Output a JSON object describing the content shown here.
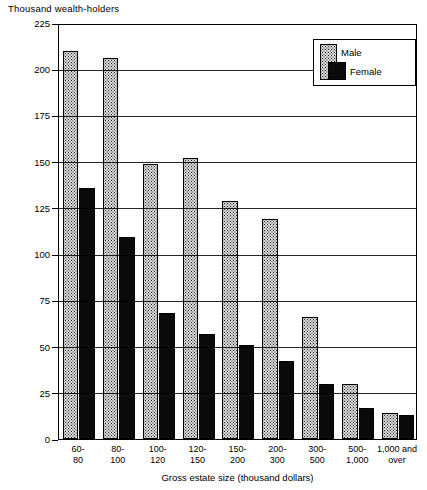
{
  "chart_data": {
    "type": "bar",
    "title": "",
    "ylabel": "Thousand wealth-holders",
    "xlabel": "Gross estate size  (thousand dollars)",
    "ylim": [
      0,
      225
    ],
    "yticks": [
      0,
      25,
      50,
      75,
      100,
      125,
      150,
      175,
      200,
      225
    ],
    "grid": true,
    "legend_position": "top-right",
    "categories": [
      "60-\n80",
      "80-\n100",
      "100-\n120",
      "120-\n150",
      "150-\n200",
      "200-\n300",
      "300-\n500",
      "500-\n1,000",
      "1,000 and\nover"
    ],
    "category_lines": [
      [
        "60-",
        "80"
      ],
      [
        "80-",
        "100"
      ],
      [
        "100-",
        "120"
      ],
      [
        "120-",
        "150"
      ],
      [
        "150-",
        "200"
      ],
      [
        "200-",
        "300"
      ],
      [
        "300-",
        "500"
      ],
      [
        "500-",
        "1,000"
      ],
      [
        "1,000 and",
        "over"
      ]
    ],
    "series": [
      {
        "name": "Male",
        "fill": "stipple",
        "color": "#d8d8d8",
        "values": [
          210,
          206,
          149,
          152,
          129,
          119,
          66,
          30,
          14
        ]
      },
      {
        "name": "Female",
        "fill": "solid",
        "color": "#0a0a0a",
        "values": [
          136,
          109,
          68,
          57,
          51,
          42,
          30,
          17,
          13
        ]
      }
    ]
  },
  "legend": {
    "male_label": "Male",
    "female_label": "Female"
  },
  "axes": {
    "y_title": "Thousand wealth-holders",
    "x_title": "Gross estate size  (thousand dollars)",
    "y_tick_labels": [
      "225",
      "200",
      "175",
      "150",
      "125",
      "100",
      "75",
      "50",
      "25",
      "0"
    ]
  }
}
